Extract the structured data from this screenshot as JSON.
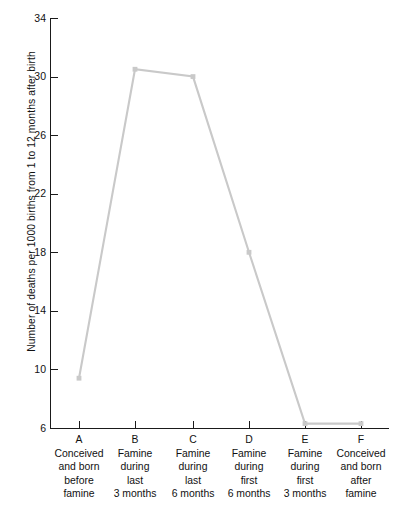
{
  "chart_data": {
    "type": "line",
    "title": "",
    "xlabel": "",
    "ylabel": "Number of deaths per 1000 births from 1 to 12 months after birth",
    "ylim": [
      6,
      34
    ],
    "yticks": [
      6,
      10,
      14,
      18,
      22,
      26,
      30,
      34
    ],
    "grid": false,
    "legend": "none",
    "categories": [
      "A",
      "B",
      "C",
      "D",
      "E",
      "F"
    ],
    "category_descriptions": [
      "Conceived\nand born\nbefore\nfamine",
      "Famine\nduring\nlast\n3 months",
      "Famine\nduring\nlast\n6 months",
      "Famine\nduring\nfirst\n6 months",
      "Famine\nduring\nfirst\n3 months",
      "Conceived\nand born\nafter\nfamine"
    ],
    "values": [
      9.4,
      30.5,
      30.0,
      18.0,
      6.3,
      6.3
    ],
    "series": [
      {
        "name": "Infant deaths per 1000 births",
        "values": [
          9.4,
          30.5,
          30.0,
          18.0,
          6.3,
          6.3
        ]
      }
    ],
    "line_color": "#c9c9c9",
    "marker": "square",
    "marker_color": "#c9c9c9",
    "axis_color": "#1a1a1a"
  }
}
